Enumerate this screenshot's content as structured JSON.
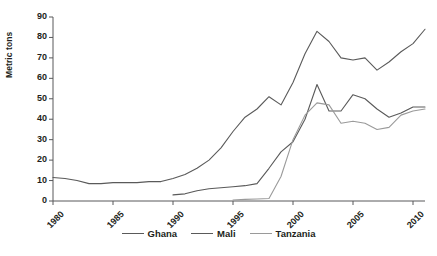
{
  "chart_data": {
    "type": "line",
    "title": "",
    "xlabel": "",
    "ylabel": "Metric tons",
    "xlim": [
      1980,
      2011
    ],
    "ylim": [
      0,
      90
    ],
    "ytick_labels": [
      "0",
      "10",
      "20",
      "30",
      "40",
      "50",
      "60",
      "70",
      "80",
      "90"
    ],
    "ytick_values": [
      0,
      10,
      20,
      30,
      40,
      50,
      60,
      70,
      80,
      90
    ],
    "xtick_labels": [
      "1980",
      "1985",
      "1990",
      "1995",
      "2000",
      "2005",
      "2010"
    ],
    "xtick_values": [
      1980,
      1985,
      1990,
      1995,
      2000,
      2005,
      2010
    ],
    "grid": false,
    "legend_position": "bottom",
    "series": [
      {
        "name": "Ghana",
        "color": "#5a5a5a",
        "x": [
          1980,
          1981,
          1982,
          1983,
          1984,
          1985,
          1986,
          1987,
          1988,
          1989,
          1990,
          1991,
          1992,
          1993,
          1994,
          1995,
          1996,
          1997,
          1998,
          1999,
          2000,
          2001,
          2002,
          2003,
          2004,
          2005,
          2006,
          2007,
          2008,
          2009,
          2010,
          2011
        ],
        "values": [
          11.5,
          11,
          10,
          8.5,
          8.5,
          9,
          9,
          9,
          9.5,
          9.5,
          11,
          13,
          16,
          20,
          26,
          34,
          41,
          45,
          51,
          47,
          58,
          72,
          83,
          78,
          70,
          69,
          70,
          64,
          68,
          73,
          77,
          84
        ]
      },
      {
        "name": "Mali",
        "color": "#5a5a5a",
        "x": [
          1990,
          1991,
          1992,
          1993,
          1994,
          1995,
          1996,
          1997,
          1998,
          1999,
          2000,
          2001,
          2002,
          2003,
          2004,
          2005,
          2006,
          2007,
          2008,
          2009,
          2010,
          2011
        ],
        "values": [
          3,
          3.5,
          5,
          6,
          6.5,
          7,
          7.5,
          8.5,
          16,
          24,
          29,
          40,
          57,
          44,
          44,
          52,
          50,
          45,
          41,
          43,
          46,
          46
        ]
      },
      {
        "name": "Tanzania",
        "color": "#9a9a9a",
        "x": [
          1995,
          1996,
          1997,
          1998,
          1999,
          2000,
          2001,
          2002,
          2003,
          2004,
          2005,
          2006,
          2007,
          2008,
          2009,
          2010,
          2011
        ],
        "values": [
          0.5,
          0.8,
          1,
          1.2,
          12,
          30,
          42,
          48,
          47,
          38,
          39,
          38,
          35,
          36,
          42,
          44,
          45
        ]
      }
    ]
  },
  "legend": {
    "items": [
      {
        "label": "Ghana"
      },
      {
        "label": "Mali"
      },
      {
        "label": "Tanzania"
      }
    ]
  }
}
